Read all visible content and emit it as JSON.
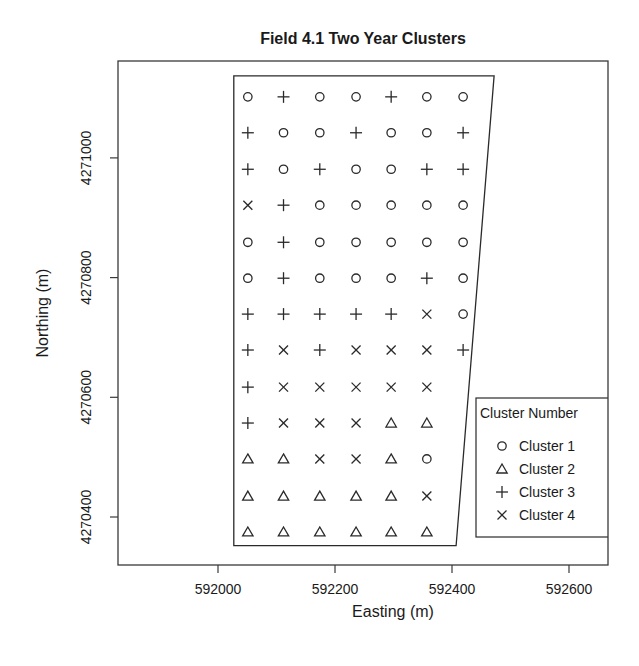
{
  "chart_data": {
    "type": "scatter",
    "title": "Field 4.1 Two Year Clusters",
    "xlabel": "Easting (m)",
    "ylabel": "Northing (m)",
    "xlim": [
      591845,
      592660
    ],
    "ylim": [
      4270320,
      4271165
    ],
    "x_ticks": [
      592000,
      592200,
      592400,
      592600
    ],
    "y_ticks": [
      4270400,
      4270600,
      4270800,
      4271000
    ],
    "grid": false,
    "legend": {
      "title": "Cluster Number",
      "position": "lower right (clipped by plot frame)",
      "entries": [
        {
          "label": "Cluster 1",
          "symbol": "circle"
        },
        {
          "label": "Cluster 2",
          "symbol": "triangle"
        },
        {
          "label": "Cluster 3",
          "symbol": "plus"
        },
        {
          "label": "Cluster 4",
          "symbol": "cross"
        }
      ]
    },
    "field_boundary": [
      [
        592027,
        4271137
      ],
      [
        592472,
        4271137
      ],
      [
        592407,
        4270352
      ],
      [
        592027,
        4270352
      ]
    ],
    "grid_easting": [
      592051,
      592112,
      592174,
      592236,
      592296,
      592357,
      592419
    ],
    "grid_northing": [
      4271102,
      4271042,
      4270981,
      4270921,
      4270859,
      4270799,
      4270739,
      4270679,
      4270617,
      4270557,
      4270497,
      4270435,
      4270375
    ],
    "cluster_grid": [
      [
        1,
        3,
        1,
        1,
        3,
        1,
        1
      ],
      [
        3,
        1,
        1,
        3,
        1,
        1,
        3
      ],
      [
        3,
        1,
        3,
        1,
        1,
        3,
        3
      ],
      [
        4,
        3,
        1,
        1,
        1,
        1,
        1
      ],
      [
        1,
        3,
        1,
        1,
        1,
        1,
        1
      ],
      [
        1,
        3,
        1,
        1,
        1,
        3,
        1
      ],
      [
        3,
        3,
        3,
        3,
        3,
        4,
        1
      ],
      [
        3,
        4,
        3,
        4,
        4,
        4,
        3
      ],
      [
        3,
        4,
        4,
        4,
        4,
        4,
        null
      ],
      [
        3,
        4,
        4,
        4,
        2,
        2,
        null
      ],
      [
        2,
        2,
        4,
        4,
        2,
        1,
        null
      ],
      [
        2,
        2,
        2,
        2,
        2,
        4,
        null
      ],
      [
        2,
        2,
        2,
        2,
        2,
        2,
        null
      ]
    ],
    "cluster_counts": {
      "Cluster 1": 30,
      "Cluster 2": 17,
      "Cluster 3": 21,
      "Cluster 4": 18
    }
  }
}
